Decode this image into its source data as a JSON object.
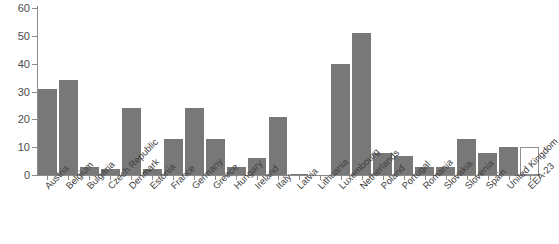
{
  "chart_data": {
    "type": "bar",
    "title": "",
    "subtitle": "",
    "xlabel": "",
    "ylabel": "",
    "ylim": [
      0,
      60
    ],
    "yticks": [
      0,
      10,
      20,
      30,
      40,
      50,
      60
    ],
    "ytick_labels": [
      "0",
      "10",
      "20",
      "30",
      "40",
      "50",
      "60"
    ],
    "grid": false,
    "legend": false,
    "legend_position": "none",
    "bar_color": "#787878",
    "highlight_bar_color": "#ffffff",
    "highlight_bar_border": "#8f8f8f",
    "axis_color": "#8a8a8a",
    "background": "#ffffff",
    "categories": [
      "Austria",
      "Belgium",
      "Bulgaria",
      "Czech Republic",
      "Denmark",
      "Estonia",
      "France",
      "Germany",
      "Greece",
      "Hungary",
      "Ireland",
      "Italy",
      "Latvia",
      "Lithuania",
      "Luxembourg",
      "Netherlands",
      "Poland",
      "Portugal",
      "Romania",
      "Slovakia",
      "Slovenia",
      "Spain",
      "United Kingdom",
      "EEA-23"
    ],
    "values": [
      31,
      34,
      3,
      2,
      24,
      2,
      13,
      24,
      13,
      3,
      6,
      21,
      0.5,
      0,
      40,
      51,
      8,
      7,
      3,
      3,
      13,
      8,
      10,
      10
    ],
    "highlight_categories": [
      "EEA-23"
    ]
  }
}
